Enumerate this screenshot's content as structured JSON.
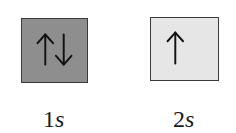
{
  "orbitals": [
    {
      "name": "1s",
      "number": "1",
      "letter": "s",
      "fill": "#8e8e8e",
      "electrons": [
        "up",
        "down"
      ]
    },
    {
      "name": "2s",
      "number": "2",
      "letter": "s",
      "fill": "#e6e6e6",
      "electrons": [
        "up"
      ]
    }
  ],
  "colors": {
    "border": "#3a3a3a",
    "arrow": "#111111",
    "text": "#1a1a1a"
  }
}
